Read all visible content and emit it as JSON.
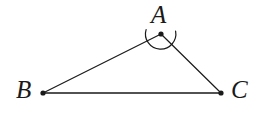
{
  "figure": {
    "type": "geometry-diagram",
    "background_color": "#ffffff",
    "stroke_color": "#1a1a1a",
    "labels": {
      "apex": "A",
      "bottom_left": "B",
      "bottom_right": "C"
    },
    "vertices": [
      {
        "name": "A",
        "x": 161,
        "y": 34
      },
      {
        "name": "B",
        "x": 43,
        "y": 93
      },
      {
        "name": "C",
        "x": 221,
        "y": 93
      }
    ],
    "edges": [
      {
        "name": "AB",
        "from": "A",
        "to": "B"
      },
      {
        "name": "BC",
        "from": "B",
        "to": "C"
      },
      {
        "name": "CA",
        "from": "C",
        "to": "A"
      }
    ],
    "angle_marks": [
      {
        "at": "A",
        "radius": 15,
        "style": "single-arc"
      }
    ],
    "vertex_dot_radius": 2.6,
    "line_width": 1.2
  }
}
